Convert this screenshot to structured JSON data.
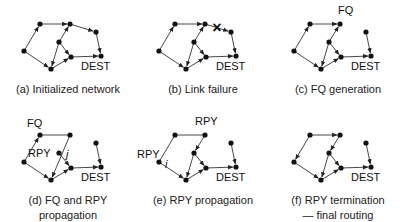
{
  "figure": {
    "nodes_base": {
      "A": [
        24,
        51
      ],
      "B": [
        40,
        24
      ],
      "C": [
        70,
        24
      ],
      "D": [
        96,
        32
      ],
      "E": [
        101,
        56
      ],
      "F": [
        59,
        42
      ],
      "G": [
        71,
        57
      ],
      "H": [
        51,
        69
      ]
    },
    "colors": {
      "line": "#333333",
      "node": "#111111",
      "text": "#111111"
    },
    "panels": [
      {
        "id": "a",
        "offset": [
          0,
          0
        ],
        "caption": [
          "(a) Initialized network"
        ],
        "edges": [
          [
            "A",
            "B",
            1
          ],
          [
            "B",
            "C",
            1
          ],
          [
            "C",
            "D",
            1
          ],
          [
            "D",
            "E",
            1
          ],
          [
            "F",
            "C",
            1
          ],
          [
            "F",
            "G",
            1
          ],
          [
            "F",
            "H",
            1
          ],
          [
            "A",
            "H",
            1
          ],
          [
            "H",
            "G",
            1
          ],
          [
            "G",
            "E",
            1
          ]
        ],
        "labels": [
          {
            "text": "DEST",
            "node": "E",
            "dx": -6,
            "dy": 14
          }
        ],
        "failure_mark": null
      },
      {
        "id": "b",
        "offset": [
          135,
          0
        ],
        "caption": [
          "(b) Link failure"
        ],
        "edges": [
          [
            "A",
            "B",
            1
          ],
          [
            "B",
            "C",
            1
          ],
          [
            "C",
            "D",
            1
          ],
          [
            "D",
            "E",
            1
          ],
          [
            "F",
            "C",
            1
          ],
          [
            "F",
            "G",
            1
          ],
          [
            "F",
            "H",
            1
          ],
          [
            "A",
            "H",
            1
          ],
          [
            "H",
            "G",
            1
          ],
          [
            "G",
            "E",
            1
          ]
        ],
        "labels": [
          {
            "text": "DEST",
            "node": "E",
            "dx": -6,
            "dy": 14
          }
        ],
        "failure_mark": {
          "symbol": "×",
          "x": 82,
          "y": 28
        }
      },
      {
        "id": "c",
        "offset": [
          270,
          0
        ],
        "caption": [
          "(c) FQ generation"
        ],
        "edges": [
          [
            "A",
            "B",
            1
          ],
          [
            "B",
            "C",
            1
          ],
          [
            "D",
            "E",
            1
          ],
          [
            "F",
            "C",
            1
          ],
          [
            "F",
            "G",
            1
          ],
          [
            "F",
            "H",
            1
          ],
          [
            "A",
            "H",
            1
          ],
          [
            "H",
            "G",
            1
          ],
          [
            "G",
            "E",
            1
          ]
        ],
        "labels": [
          {
            "text": "DEST",
            "node": "E",
            "dx": -6,
            "dy": 14
          },
          {
            "text": "FQ",
            "node": "C",
            "dx": -2,
            "dy": -10
          }
        ],
        "failure_mark": null
      },
      {
        "id": "d",
        "offset": [
          0,
          111
        ],
        "caption": [
          "(d) FQ and RPY",
          "propagation"
        ],
        "edges": [
          [
            "A",
            "B",
            1
          ],
          [
            "B",
            "C",
            0
          ],
          [
            "C",
            "H",
            1
          ],
          [
            "D",
            "E",
            1
          ],
          [
            "F",
            "G",
            1
          ],
          [
            "A",
            "H",
            1
          ],
          [
            "H",
            "G",
            1
          ],
          [
            "G",
            "E",
            1
          ]
        ],
        "labels": [
          {
            "text": "DEST",
            "node": "E",
            "dx": -6,
            "dy": 14
          },
          {
            "text": "FQ",
            "node": "B",
            "dx": -13,
            "dy": -8
          },
          {
            "text": "RPY",
            "node": "F",
            "dx": -31,
            "dy": 4
          },
          {
            "text": "j",
            "node": "F",
            "dx": 7,
            "dy": 5,
            "italic": true
          }
        ],
        "failure_mark": null
      },
      {
        "id": "e",
        "offset": [
          135,
          111
        ],
        "caption": [
          "(e) RPY propagation"
        ],
        "edges": [
          [
            "B",
            "C",
            0
          ],
          [
            "C",
            "F",
            1
          ],
          [
            "B",
            "A",
            0
          ],
          [
            "A",
            "H",
            1
          ],
          [
            "D",
            "E",
            1
          ],
          [
            "F",
            "G",
            1
          ],
          [
            "F",
            "H",
            1
          ],
          [
            "H",
            "G",
            1
          ],
          [
            "G",
            "E",
            1
          ]
        ],
        "labels": [
          {
            "text": "DEST",
            "node": "E",
            "dx": -6,
            "dy": 14
          },
          {
            "text": "RPY",
            "node": "C",
            "dx": -10,
            "dy": -10
          },
          {
            "text": "RPY",
            "node": "A",
            "dx": -22,
            "dy": -4
          },
          {
            "text": "i",
            "node": "A",
            "dx": 6,
            "dy": 6,
            "italic": true
          }
        ],
        "failure_mark": null
      },
      {
        "id": "f",
        "offset": [
          270,
          111
        ],
        "caption": [
          "(f) RPY termination",
          "— final routing"
        ],
        "edges": [
          [
            "B",
            "C",
            1
          ],
          [
            "C",
            "F",
            1
          ],
          [
            "B",
            "A",
            1
          ],
          [
            "A",
            "H",
            1
          ],
          [
            "D",
            "E",
            1
          ],
          [
            "F",
            "G",
            1
          ],
          [
            "F",
            "H",
            1
          ],
          [
            "H",
            "G",
            1
          ],
          [
            "G",
            "E",
            1
          ]
        ],
        "labels": [
          {
            "text": "DEST",
            "node": "E",
            "dx": -6,
            "dy": 14
          }
        ],
        "failure_mark": null
      }
    ]
  }
}
